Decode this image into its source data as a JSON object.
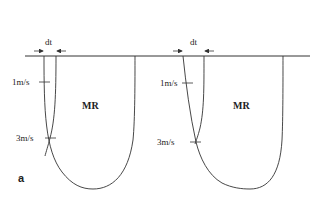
{
  "figure": {
    "panel_label": "a",
    "left": {
      "dt_label": "dt",
      "region_label": "MR",
      "velocity_1": "1m/s",
      "velocity_3": "3m/s"
    },
    "right": {
      "dt_label": "dt",
      "region_label": "MR",
      "velocity_1": "1m/s",
      "velocity_3": "3m/s"
    },
    "colors": {
      "line": "#333333",
      "background": "#ffffff"
    }
  }
}
